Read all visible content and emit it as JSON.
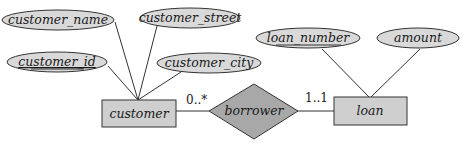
{
  "diagram": {
    "type": "ER diagram",
    "entities": [
      {
        "id": "customer",
        "label": "customer"
      },
      {
        "id": "loan",
        "label": "loan"
      }
    ],
    "relationships": [
      {
        "id": "borrower",
        "label": "borrower",
        "connects": [
          "customer",
          "loan"
        ]
      }
    ],
    "attributes": [
      {
        "entity": "customer",
        "label": "customer_name",
        "key": false
      },
      {
        "entity": "customer",
        "label": "customer_street",
        "key": false
      },
      {
        "entity": "customer",
        "label": "customer_id",
        "key": true
      },
      {
        "entity": "customer",
        "label": "customer_city",
        "key": false
      },
      {
        "entity": "loan",
        "label": "loan_number",
        "key": true
      },
      {
        "entity": "loan",
        "label": "amount",
        "key": false
      }
    ],
    "cardinalities": {
      "customer_side": "0..*",
      "loan_side": "1..1"
    }
  }
}
